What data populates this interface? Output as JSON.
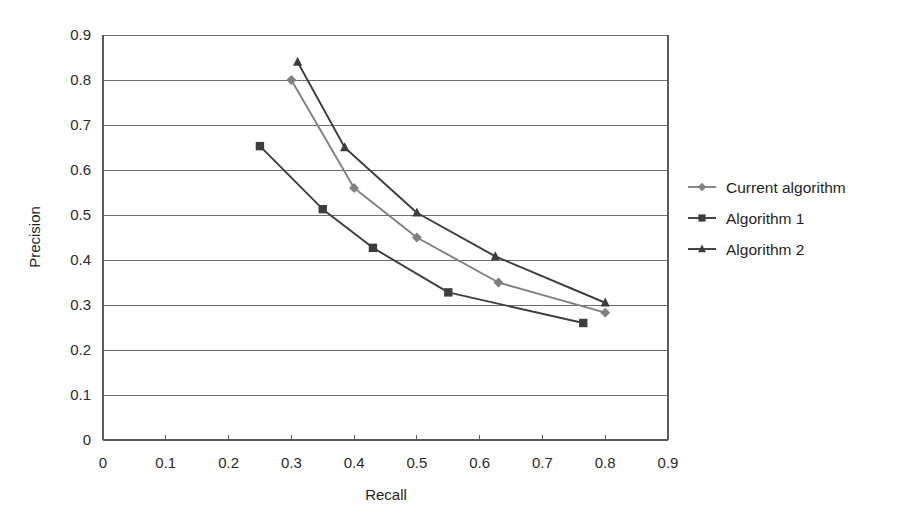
{
  "chart_data": {
    "type": "line",
    "title": "",
    "xlabel": "Recall",
    "ylabel": "Precision",
    "xlim": [
      0,
      0.9
    ],
    "ylim": [
      0,
      0.9
    ],
    "xticks": [
      "0",
      "0.1",
      "0.2",
      "0.3",
      "0.4",
      "0.5",
      "0.6",
      "0.7",
      "0.8",
      "0.9"
    ],
    "yticks": [
      "0",
      "0.1",
      "0.2",
      "0.3",
      "0.4",
      "0.5",
      "0.6",
      "0.7",
      "0.8",
      "0.9"
    ],
    "grid": "horizontal",
    "legend_position": "right",
    "series": [
      {
        "name": "Current algorithm",
        "marker": "diamond",
        "color": "#808080",
        "x": [
          0.3,
          0.4,
          0.5,
          0.63,
          0.8
        ],
        "y": [
          0.8,
          0.56,
          0.45,
          0.35,
          0.283
        ]
      },
      {
        "name": "Algorithm 1",
        "marker": "square",
        "color": "#3d3d3d",
        "x": [
          0.25,
          0.35,
          0.43,
          0.55,
          0.765
        ],
        "y": [
          0.653,
          0.513,
          0.427,
          0.328,
          0.26
        ]
      },
      {
        "name": "Algorithm 2",
        "marker": "triangle",
        "color": "#3d3d3d",
        "x": [
          0.31,
          0.385,
          0.5,
          0.625,
          0.8
        ],
        "y": [
          0.84,
          0.65,
          0.505,
          0.408,
          0.305
        ]
      }
    ]
  },
  "axes": {
    "x_title": "Recall",
    "y_title": "Precision",
    "x_tick_labels": [
      "0",
      "0.1",
      "0.2",
      "0.3",
      "0.4",
      "0.5",
      "0.6",
      "0.7",
      "0.8",
      "0.9"
    ],
    "y_tick_labels": [
      "0",
      "0.1",
      "0.2",
      "0.3",
      "0.4",
      "0.5",
      "0.6",
      "0.7",
      "0.8",
      "0.9"
    ]
  },
  "legend": {
    "items": [
      {
        "label": "Current algorithm",
        "marker": "diamond-marker",
        "color": "#808080"
      },
      {
        "label": "Algorithm 1",
        "marker": "square-marker",
        "color": "#3d3d3d"
      },
      {
        "label": "Algorithm 2",
        "marker": "triangle-marker",
        "color": "#3d3d3d"
      }
    ]
  },
  "colors": {
    "background": "#ffffff",
    "grid": "#6e6e6e",
    "axis": "#5a5a5a",
    "text": "#1f1f1f",
    "series_current": "#808080",
    "series_alg1": "#3d3d3d",
    "series_alg2": "#3d3d3d"
  }
}
